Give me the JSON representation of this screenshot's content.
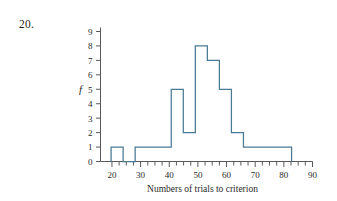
{
  "problem": {
    "number": "20."
  },
  "chart_data": {
    "type": "bar",
    "title": "",
    "subtitle": "",
    "xlabel": "Numbers of trials to criterion",
    "ylabel": "f",
    "xlim": [
      16,
      90
    ],
    "ylim": [
      0,
      9
    ],
    "grid": false,
    "legend": null,
    "xticks": [
      20,
      30,
      40,
      50,
      60,
      70,
      80,
      90
    ],
    "xtick_labels": [
      "20",
      "30",
      "40",
      "50",
      "60",
      "70",
      "80",
      "90"
    ],
    "xminor_step": 2.5,
    "yticks": [
      0,
      1,
      2,
      3,
      4,
      5,
      6,
      7,
      8,
      9
    ],
    "ytick_labels": [
      "0",
      "1",
      "2",
      "3",
      "4",
      "5",
      "6",
      "7",
      "8",
      "9"
    ],
    "bin_width": 4.2,
    "bin_starts": [
      19.7,
      23.9,
      28.1,
      32.3,
      36.5,
      40.7,
      44.9,
      49.1,
      53.3,
      57.5,
      61.7,
      65.9,
      70.1,
      74.3,
      78.5
    ],
    "categories": [
      "19.7-23.9",
      "23.9-28.1",
      "28.1-32.3",
      "32.3-36.5",
      "36.5-40.7",
      "40.7-44.9",
      "44.9-49.1",
      "49.1-53.3",
      "53.3-57.5",
      "57.5-61.7",
      "61.7-65.9",
      "65.9-70.1",
      "70.1-74.3",
      "74.3-78.5",
      "78.5-82.7"
    ],
    "values": [
      1,
      0,
      1,
      1,
      1,
      5,
      2,
      8,
      7,
      5,
      2,
      1,
      1,
      1,
      1
    ],
    "bar_style": "outline",
    "bar_color": "#ffffff",
    "line_color": "#4a7a94"
  },
  "colors": {
    "line": "#4a7a94",
    "axis": "#5a5a5a",
    "text": "#2a2a2a"
  }
}
